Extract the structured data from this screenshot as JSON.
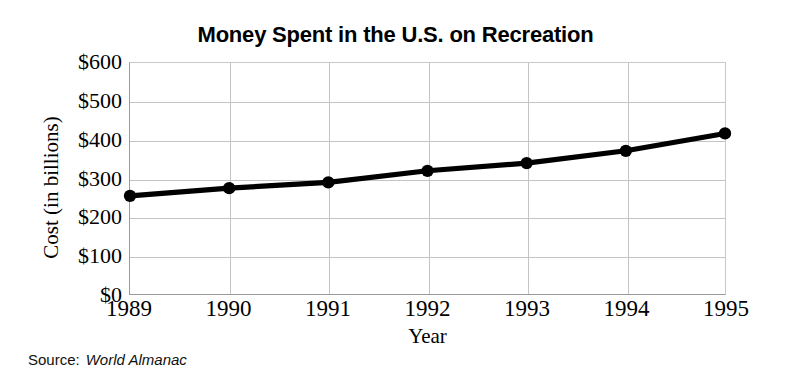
{
  "chart_data": {
    "type": "line",
    "title": "Money Spent in the U.S. on Recreation",
    "xlabel": "Year",
    "ylabel": "Cost (in billions)",
    "categories": [
      "1989",
      "1990",
      "1991",
      "1992",
      "1993",
      "1994",
      "1995"
    ],
    "values": [
      255,
      275,
      290,
      320,
      340,
      372,
      417
    ],
    "series": [
      {
        "name": "Money spent on recreation",
        "values": [
          255,
          275,
          290,
          320,
          340,
          372,
          417
        ]
      }
    ],
    "ylim": [
      0,
      600
    ],
    "y_ticks": [
      0,
      100,
      200,
      300,
      400,
      500,
      600
    ],
    "y_tick_labels": [
      "$0",
      "$100",
      "$200",
      "$300",
      "$400",
      "$500",
      "$600"
    ],
    "x_tick_labels": [
      "1989",
      "1990",
      "1991",
      "1992",
      "1993",
      "1994",
      "1995"
    ],
    "grid": true,
    "legend": "none",
    "line_color": "#000000",
    "marker_color": "#000000",
    "grid_color": "#c4c4c4",
    "background_color": "#ffffff"
  },
  "source": {
    "label": "Source:",
    "value": "World Almanac"
  }
}
